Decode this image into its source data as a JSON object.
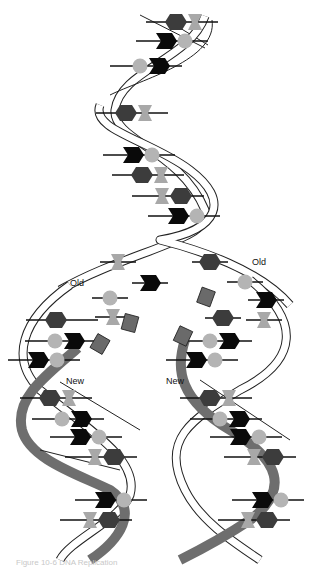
{
  "figure": {
    "title": "DNA replication",
    "labels": {
      "old_left": "Old",
      "old_right": "Old",
      "new_left": "New",
      "new_right": "New"
    },
    "caption": "Figure 10-6 DNA Replication"
  },
  "colors": {
    "backbone_fill": "#ffffff",
    "backbone_stroke": "#222222",
    "new_strand": "#6e6e6e",
    "hexagon": "#3c3c3c",
    "chevron": "#0a0a0a",
    "circle": "#b4b4b4",
    "bowtie": "#a8a8a8",
    "free_square": "#6a6a6a"
  },
  "base_legend": [
    "hexagon-base",
    "chevron-base",
    "circle-base",
    "bowtie-base"
  ],
  "pairs": [
    {
      "x": 176,
      "y": 22,
      "a": "hexagon",
      "b": "bowtie"
    },
    {
      "x": 166,
      "y": 41,
      "a": "chevron",
      "b": "circle"
    },
    {
      "x": 140,
      "y": 66,
      "a": "circle",
      "b": "chevron"
    },
    {
      "x": 126,
      "y": 113,
      "a": "hexagon",
      "b": "bowtie"
    },
    {
      "x": 133,
      "y": 155,
      "a": "chevron",
      "b": "circle"
    },
    {
      "x": 142,
      "y": 175,
      "a": "hexagon",
      "b": "bowtie"
    },
    {
      "x": 162,
      "y": 196,
      "a": "bowtie",
      "b": "hexagon"
    },
    {
      "x": 178,
      "y": 216,
      "a": "chevron",
      "b": "circle"
    },
    {
      "x": 56,
      "y": 320,
      "a": "hexagon",
      "b": null
    },
    {
      "x": 55,
      "y": 341,
      "a": "circle",
      "b": "chevron"
    },
    {
      "x": 38,
      "y": 360,
      "a": "chevron",
      "b": "circle"
    },
    {
      "x": 50,
      "y": 398,
      "a": "hexagon",
      "b": "bowtie"
    },
    {
      "x": 62,
      "y": 419,
      "a": "circle",
      "b": "chevron"
    },
    {
      "x": 80,
      "y": 437,
      "a": "chevron",
      "b": "circle"
    },
    {
      "x": 95,
      "y": 457,
      "a": "bowtie",
      "b": "hexagon"
    },
    {
      "x": 105,
      "y": 500,
      "a": "chevron",
      "b": "circle"
    },
    {
      "x": 90,
      "y": 520,
      "a": "bowtie",
      "b": "hexagon"
    },
    {
      "x": 210,
      "y": 341,
      "a": "circle",
      "b": "chevron"
    },
    {
      "x": 196,
      "y": 360,
      "a": "chevron",
      "b": "circle"
    },
    {
      "x": 210,
      "y": 398,
      "a": "hexagon",
      "b": "bowtie"
    },
    {
      "x": 220,
      "y": 419,
      "a": "circle",
      "b": "chevron"
    },
    {
      "x": 240,
      "y": 437,
      "a": "chevron",
      "b": "circle"
    },
    {
      "x": 254,
      "y": 457,
      "a": "bowtie",
      "b": "hexagon"
    },
    {
      "x": 262,
      "y": 500,
      "a": "chevron",
      "b": "circle"
    },
    {
      "x": 248,
      "y": 520,
      "a": "bowtie",
      "b": "hexagon"
    }
  ],
  "single_bases": [
    {
      "x": 150,
      "y": 283,
      "shape": "chevron"
    },
    {
      "x": 110,
      "y": 298,
      "shape": "circle"
    },
    {
      "x": 118,
      "y": 262,
      "shape": "bowtie"
    },
    {
      "x": 210,
      "y": 262,
      "shape": "hexagon"
    },
    {
      "x": 245,
      "y": 282,
      "shape": "circle"
    },
    {
      "x": 266,
      "y": 300,
      "shape": "chevron"
    },
    {
      "x": 264,
      "y": 320,
      "shape": "bowtie"
    },
    {
      "x": 113,
      "y": 317,
      "shape": "bowtie"
    },
    {
      "x": 223,
      "y": 318,
      "shape": "hexagon"
    }
  ],
  "free_nucleotides": [
    {
      "x": 130,
      "y": 323,
      "rot": 15
    },
    {
      "x": 100,
      "y": 344,
      "rot": 30
    },
    {
      "x": 206,
      "y": 297,
      "rot": 20
    },
    {
      "x": 183,
      "y": 336,
      "rot": 25
    }
  ]
}
